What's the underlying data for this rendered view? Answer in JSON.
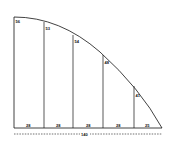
{
  "diagram": {
    "stroke_color": "#111111",
    "background": "#ffffff",
    "ordinates": [
      {
        "label": "56",
        "x": 14,
        "y_top": 17
      },
      {
        "label": "53",
        "x": 44,
        "y_top": 22
      },
      {
        "label": "54",
        "x": 73,
        "y_top": 35
      },
      {
        "label": "48",
        "x": 103,
        "y_top": 55
      },
      {
        "label": "41",
        "x": 134,
        "y_top": 86
      }
    ],
    "intervals": [
      {
        "label": "28"
      },
      {
        "label": "28"
      },
      {
        "label": "28"
      },
      {
        "label": "28"
      },
      {
        "label": "25"
      }
    ],
    "total_length": {
      "label": "140"
    }
  }
}
